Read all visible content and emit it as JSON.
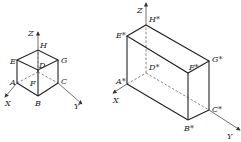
{
  "figure_left": {
    "title": "unit cube",
    "axes": {
      "x": "X",
      "y": "Y",
      "z": "Z"
    },
    "vertices": {
      "A": "A",
      "B": "B",
      "C": "C",
      "D": "D",
      "E": "E",
      "F": "F",
      "G": "G",
      "H": "H"
    }
  },
  "figure_right": {
    "title": "transformed box",
    "axes": {
      "x": "X",
      "y": "Y",
      "z": "Z"
    },
    "vertices": {
      "A": "A*",
      "B": "B*",
      "C": "C*",
      "D": "D*",
      "E": "E*",
      "F": "F*",
      "G": "G*",
      "H": "H*"
    }
  }
}
